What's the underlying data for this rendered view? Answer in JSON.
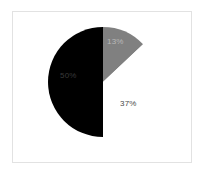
{
  "chart_data": {
    "type": "pie",
    "title": "",
    "subtitle": "",
    "xlabel": "",
    "ylabel": "",
    "legend": "none",
    "grid": false,
    "start_angle_deg": 90,
    "direction": "clockwise",
    "categories": [
      "13%",
      "37%",
      "50%"
    ],
    "values": [
      13,
      37,
      50
    ],
    "slices": [
      {
        "label": "13%",
        "value": 13,
        "color": "#808080",
        "label_color": "#b9b9b9",
        "label_inside": true
      },
      {
        "label": "37%",
        "value": 37,
        "color": "#ffffff",
        "label_color": "#4a4a4a",
        "label_inside": true
      },
      {
        "label": "50%",
        "value": 50,
        "color": "#000000",
        "label_color": "#3a3a3a",
        "label_inside": true
      }
    ],
    "colors": [
      "#808080",
      "#ffffff",
      "#000000"
    ],
    "background": "#ffffff",
    "frame_color": "#e2e2e2"
  },
  "labels": {
    "slice_gray": "13%",
    "slice_white": "37%",
    "slice_black": "50%"
  }
}
